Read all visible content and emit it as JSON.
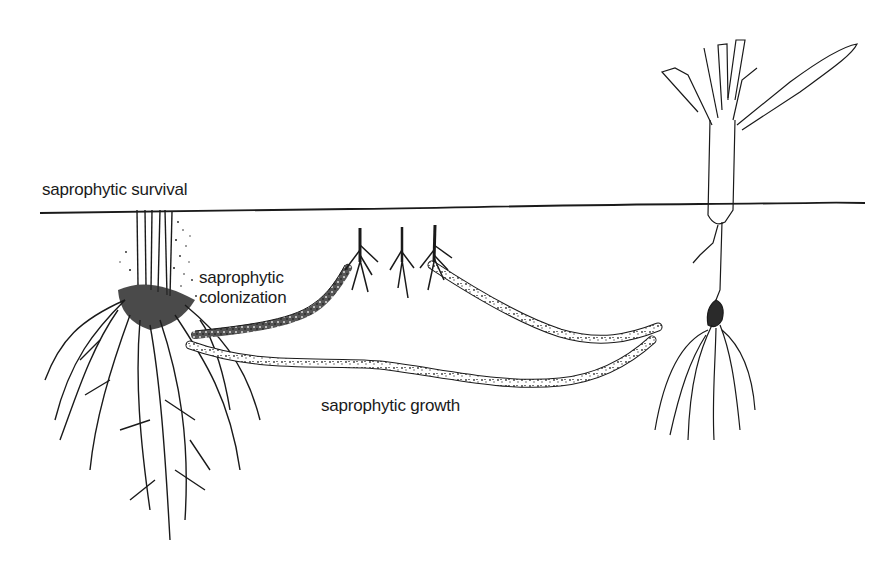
{
  "figure": {
    "type": "biological-life-cycle-diagram",
    "soil_line": true,
    "labels": {
      "survival": "saprophytic survival",
      "colonization_line1": "saprophytic",
      "colonization_line2": "colonization",
      "growth": "saprophytic growth"
    },
    "elements": [
      {
        "name": "old-plant-stubble-with-roots",
        "position": "left"
      },
      {
        "name": "colonized-residue-fragments",
        "count": 3,
        "position": "center-top"
      },
      {
        "name": "runner-hyphae-strands",
        "count": 3
      },
      {
        "name": "new-seedling",
        "position": "right"
      }
    ],
    "colors": {
      "ink": "#1a1a1a",
      "paper": "#ffffff",
      "bleed_through": "#d8d8d8"
    }
  }
}
